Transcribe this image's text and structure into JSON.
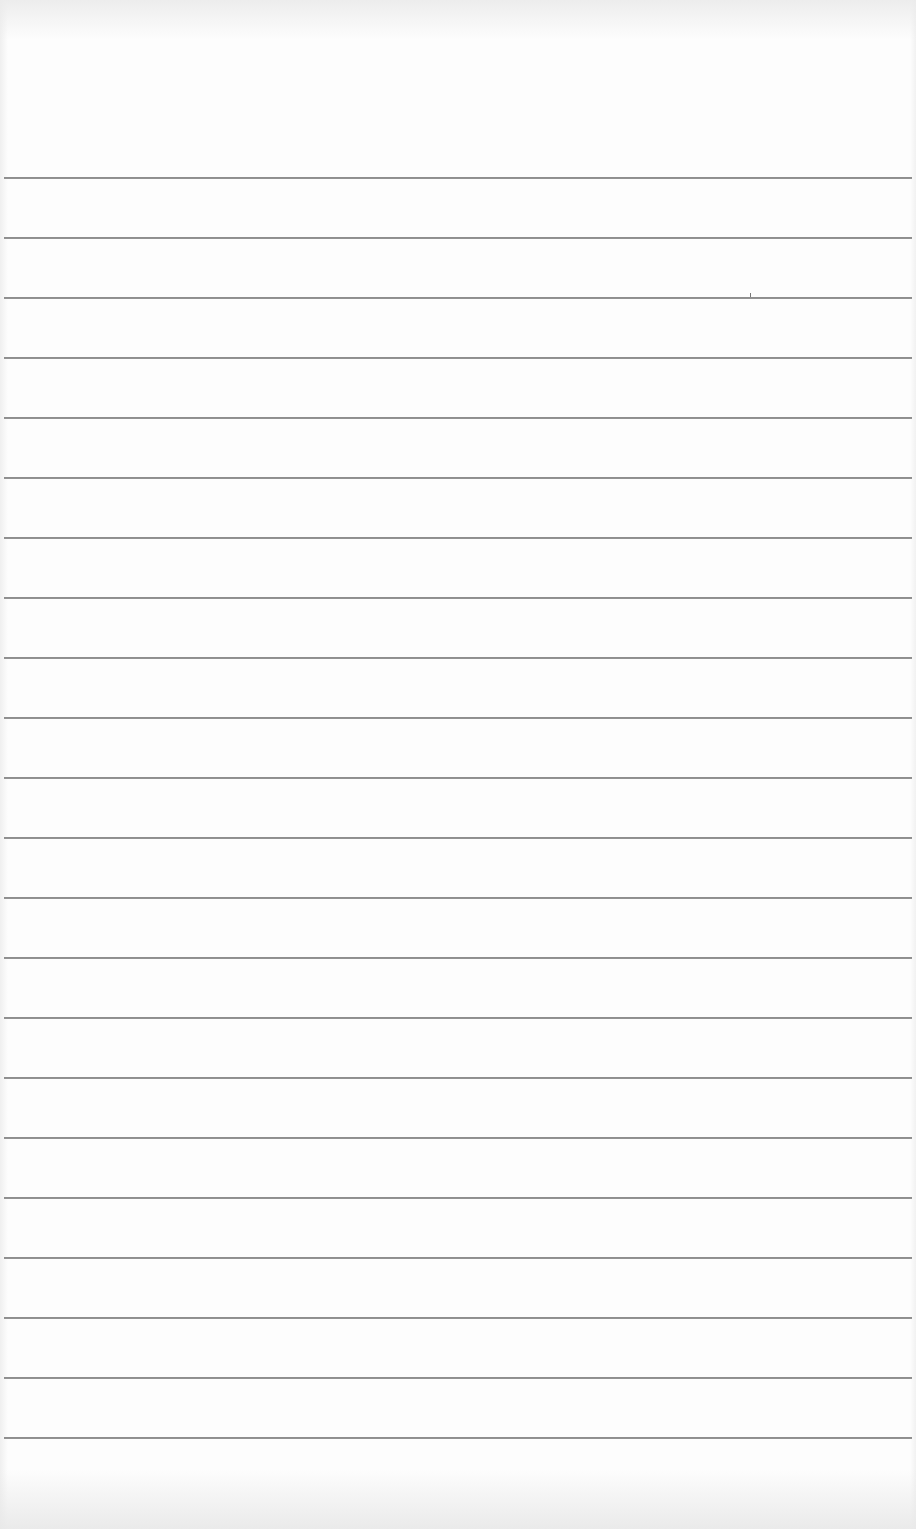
{
  "document": {
    "type": "ruled-paper",
    "orientation": "portrait",
    "background_color": "#fdfdfd",
    "rule_color": "#8e8e8e",
    "rule_count": 22,
    "first_rule_y": 177,
    "rule_spacing": 60,
    "rule_left": 4,
    "rule_right": 912,
    "lines_text": [
      "",
      "",
      "",
      "",
      "",
      "",
      "",
      "",
      "",
      "",
      "",
      "",
      "",
      "",
      "",
      "",
      "",
      "",
      "",
      "",
      "",
      ""
    ]
  }
}
